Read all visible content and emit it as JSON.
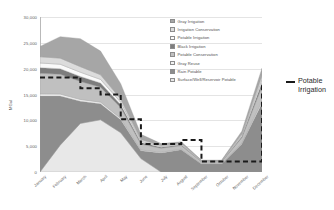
{
  "chart_data": {
    "type": "area",
    "stacked": true,
    "title": "",
    "xlabel": "",
    "ylabel": "MGal",
    "ylim": [
      0,
      30000
    ],
    "yticks": [
      "0",
      "5,000",
      "10,000",
      "15,000",
      "20,000",
      "25,000",
      "30,000"
    ],
    "ytick_values": [
      0,
      5000,
      10000,
      15000,
      20000,
      25000,
      30000
    ],
    "grid": true,
    "legend_position": "inside-top-right",
    "categories": [
      "January",
      "February",
      "March",
      "April",
      "May",
      "June",
      "July",
      "August",
      "September",
      "October",
      "November",
      "December"
    ],
    "series": [
      {
        "name": "Surface/Well/Reservoir Potable",
        "color": "#e8e8e8",
        "values": [
          0,
          5200,
          9400,
          10100,
          7600,
          2600,
          0,
          0,
          0,
          0,
          0,
          0
        ]
      },
      {
        "name": "Rain Potable",
        "color": "#8d8d8d",
        "values": [
          14700,
          9500,
          4300,
          3100,
          2500,
          1500,
          3700,
          4300,
          1550,
          1550,
          5400,
          13300
        ]
      },
      {
        "name": "Gray Reuse",
        "color": "#f2f2f2",
        "values": [
          400,
          380,
          340,
          320,
          260,
          160,
          120,
          110,
          60,
          60,
          180,
          420
        ]
      },
      {
        "name": "Potable Conservation",
        "color": "#c0c0c0",
        "values": [
          4000,
          3850,
          3500,
          2900,
          2100,
          1150,
          800,
          700,
          350,
          350,
          1050,
          2900
        ]
      },
      {
        "name": "Black Irrigation",
        "color": "#7d7d7d",
        "values": [
          1100,
          1050,
          950,
          800,
          560,
          300,
          180,
          150,
          80,
          80,
          250,
          700
        ]
      },
      {
        "name": "Potable Irrigation",
        "color": "#fafafa",
        "values": [
          900,
          880,
          820,
          700,
          480,
          250,
          150,
          120,
          60,
          60,
          200,
          600
        ]
      },
      {
        "name": "Irrigation Conservation",
        "color": "#dcdcdc",
        "values": [
          1200,
          1180,
          1080,
          900,
          620,
          330,
          200,
          170,
          80,
          80,
          260,
          780
        ]
      },
      {
        "name": "Gray Irrigation",
        "color": "#a6a6a6",
        "values": [
          2000,
          4160,
          5410,
          4580,
          2980,
          1010,
          350,
          300,
          120,
          120,
          560,
          1400
        ]
      }
    ],
    "reference_line": {
      "name": "Potable Irrigation",
      "style": "dashed",
      "color": "#1a1a1a",
      "values": [
        18300,
        18300,
        16200,
        15000,
        10200,
        5400,
        5400,
        6200,
        2050,
        2050,
        2050,
        17200
      ]
    },
    "annotation": {
      "label": "Potable\nIrrigation"
    }
  },
  "legend": {
    "items": [
      {
        "label": "Gray Irrigation",
        "color": "#a6a6a6"
      },
      {
        "label": "Irrigation Conservation",
        "color": "#dcdcdc"
      },
      {
        "label": "Potable Irrigation",
        "color": "#fafafa"
      },
      {
        "label": "Black Irrigation",
        "color": "#7d7d7d"
      },
      {
        "label": "Potable Conservation",
        "color": "#c0c0c0"
      },
      {
        "label": "Gray Reuse",
        "color": "#f2f2f2"
      },
      {
        "label": "Rain Potable",
        "color": "#8d8d8d"
      },
      {
        "label": "Surface/Well/Reservoir Potable",
        "color": "#e8e8e8"
      }
    ]
  }
}
